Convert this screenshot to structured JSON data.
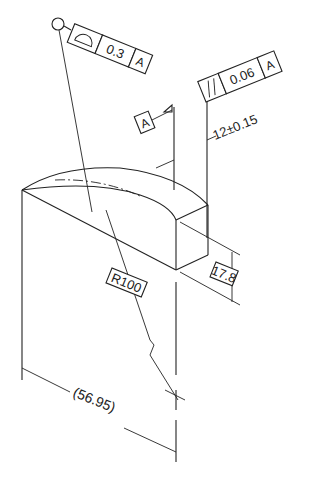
{
  "drawing": {
    "type": "isometric engineering drawing with GD&T callouts",
    "profile_fcf": {
      "symbol": "profile-of-a-surface",
      "tolerance": "0.3",
      "datum": "A"
    },
    "parallelism_fcf": {
      "symbol": "parallelism",
      "tolerance": "0.06",
      "datum": "A"
    },
    "datum_label": "A",
    "dim_width": "12±0.15",
    "dim_height": "17.8",
    "dim_radius": "R100",
    "dim_length": "(56.95)"
  },
  "colors": {
    "line": "#222222",
    "background": "#ffffff"
  }
}
